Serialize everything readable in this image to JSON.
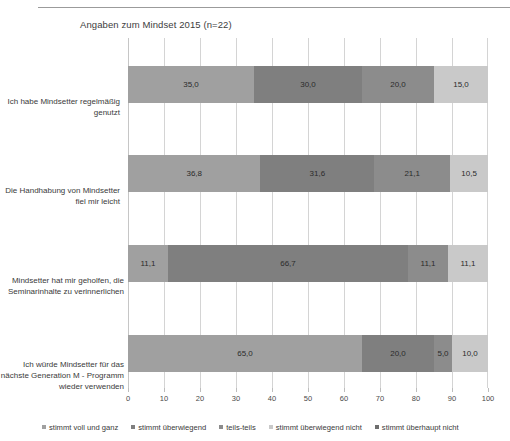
{
  "chart_data": {
    "type": "bar",
    "orientation": "horizontal",
    "stacked": true,
    "stack_mode": "percent",
    "title": "Angaben zum Mindset 2015 (n=22)",
    "xlabel": "",
    "ylabel": "",
    "xlim": [
      0,
      100
    ],
    "xticks": [
      0,
      10,
      20,
      30,
      40,
      50,
      60,
      70,
      80,
      90,
      100
    ],
    "xtick_labels": [
      "0",
      "10",
      "20",
      "30",
      "40",
      "50",
      "60",
      "70",
      "80",
      "90",
      "100"
    ],
    "grid": "vertical",
    "legend_position": "bottom",
    "categories": [
      "Ich habe Mindsetter regelmäßig genutzt",
      "Die Handhabung von Mindsetter fiel mir leicht",
      "Mindsetter hat mir geholfen, die Seminarinhalte zu verinnerlichen",
      "Ich würde Mindsetter für das nächste Generation M - Programm wieder verwenden"
    ],
    "series": [
      {
        "name": "stimmt voll und ganz",
        "color": "#a0a0a0",
        "values": [
          35.0,
          36.8,
          11.1,
          65.0
        ],
        "labels": [
          "35,0",
          "36,8",
          "11,1",
          "65,0"
        ]
      },
      {
        "name": "stimmt überwiegend",
        "color": "#7f7f7f",
        "values": [
          30.0,
          31.6,
          66.7,
          20.0
        ],
        "labels": [
          "30,0",
          "31,6",
          "66,7",
          "20,0"
        ]
      },
      {
        "name": "teils-teils",
        "color": "#8c8c8c",
        "values": [
          20.0,
          21.1,
          11.1,
          5.0
        ],
        "labels": [
          "20,0",
          "21,1",
          "11,1",
          "5,0"
        ]
      },
      {
        "name": "stimmt überwiegend nicht",
        "color": "#c9c9c9",
        "values": [
          15.0,
          10.5,
          11.1,
          10.0
        ],
        "labels": [
          "15,0",
          "10,5",
          "11,1",
          "10,0"
        ]
      },
      {
        "name": "stimmt überhaupt nicht",
        "color": "#6e6e6e",
        "values": [
          0.0,
          0.0,
          0.0,
          0.0
        ],
        "labels": [
          "",
          "",
          "",
          ""
        ]
      }
    ]
  },
  "legend": {
    "items": [
      {
        "label": "stimmt voll und ganz",
        "color": "#a0a0a0"
      },
      {
        "label": "stimmt überwiegend",
        "color": "#7f7f7f"
      },
      {
        "label": "teils-teils",
        "color": "#8c8c8c"
      },
      {
        "label": "stimmt überwiegend nicht",
        "color": "#c9c9c9"
      },
      {
        "label": "stimmt überhaupt nicht",
        "color": "#6e6e6e"
      }
    ]
  },
  "axis": {
    "tick_labels": [
      "0",
      "10",
      "20",
      "30",
      "40",
      "50",
      "60",
      "70",
      "80",
      "90",
      "100"
    ]
  }
}
